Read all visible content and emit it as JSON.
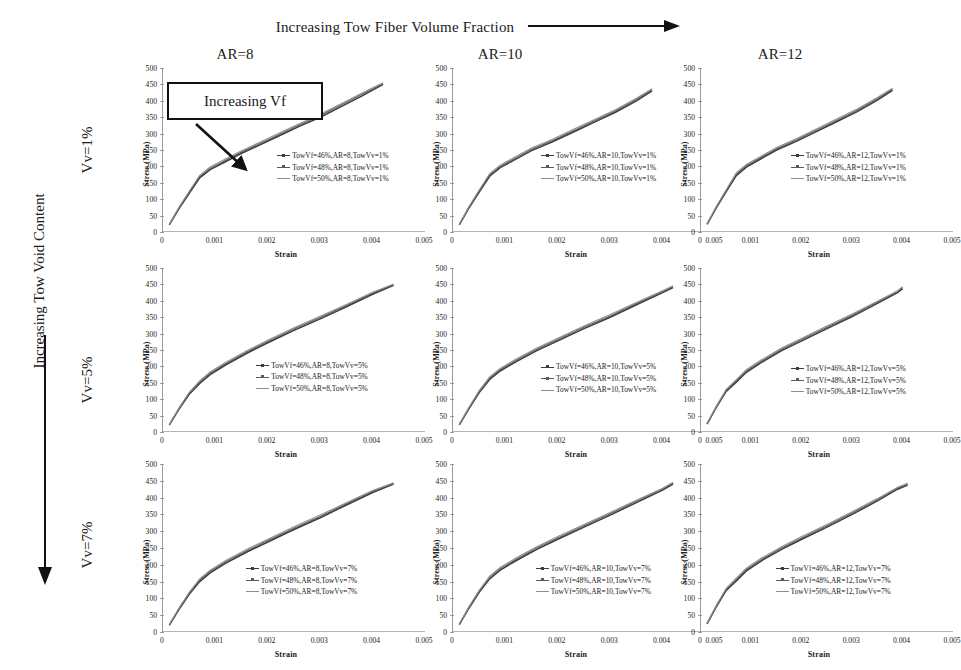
{
  "figure": {
    "top_header": {
      "text": "Increasing Tow Fiber Volume Fraction",
      "arrow": "right-arrow"
    },
    "left_header": {
      "text": "Increasing Tow Void Content",
      "arrow": "down-arrow"
    },
    "column_headers": [
      "AR=8",
      "AR=10",
      "AR=12"
    ],
    "row_headers": [
      "Vv=1%",
      "Vv=5%",
      "Vv=7%"
    ],
    "annotation": {
      "label": "Increasing Vf",
      "arrow": "diagonal-down-right-arrow"
    }
  },
  "axes": {
    "xlabel": "Strain",
    "ylabel": "Stress (MPa)",
    "yticks": [
      0,
      50,
      100,
      150,
      200,
      250,
      300,
      350,
      400,
      450,
      500
    ],
    "xticks": [
      "0",
      "0.001",
      "0.002",
      "0.003",
      "0.004",
      "0.005"
    ],
    "xlim": [
      0,
      0.005
    ],
    "ylim": [
      0,
      500
    ]
  },
  "colors": {
    "series_46": "#3c3c3c",
    "series_48": "#5a5a5a",
    "series_50": "#8d8d8d",
    "axis": "#9a9a9a",
    "text": "#1a1a1a",
    "arrow": "#111111"
  },
  "chart_data": [
    {
      "id": "ar8-vv1",
      "type": "line",
      "title": "AR=8, Vv=1%",
      "row": "Vv=1%",
      "column": "AR=8",
      "xlabel": "Strain",
      "ylabel": "Stress (MPa)",
      "xlim": [
        0,
        0.005
      ],
      "ylim": [
        0,
        500
      ],
      "grid": false,
      "legend_position": "center-right-inside",
      "legend": [
        "TowVf=46%,AR=8,TowVv=1%",
        "TowVf=48%,AR=8,TowVv=1%",
        "TowVf=50%,AR=8,TowVv=1%"
      ],
      "x": [
        0.00012,
        0.0003,
        0.0005,
        0.0007,
        0.0009,
        0.0012,
        0.0015,
        0.0018,
        0.0022,
        0.0026,
        0.003,
        0.0034,
        0.0038,
        0.0042
      ],
      "series": [
        {
          "name": "TowVf=46%,AR=8,TowVv=1%",
          "values": [
            22,
            70,
            118,
            165,
            190,
            215,
            240,
            262,
            292,
            322,
            350,
            382,
            415,
            450
          ]
        },
        {
          "name": "TowVf=48%,AR=8,TowVv=1%",
          "values": [
            23,
            72,
            121,
            169,
            194,
            219,
            244,
            266,
            296,
            326,
            355,
            387,
            420,
            452
          ]
        },
        {
          "name": "TowVf=50%,AR=8,TowVv=1%",
          "values": [
            24,
            74,
            124,
            173,
            198,
            223,
            248,
            270,
            300,
            330,
            359,
            391,
            424,
            455
          ]
        }
      ]
    },
    {
      "id": "ar10-vv1",
      "type": "line",
      "title": "AR=10, Vv=1%",
      "row": "Vv=1%",
      "column": "AR=10",
      "xlabel": "Strain",
      "ylabel": "Stress (MPa)",
      "xlim": [
        0,
        0.005
      ],
      "ylim": [
        0,
        500
      ],
      "grid": false,
      "legend_position": "center-inside",
      "legend": [
        "TowVf=46%,AR=10,TowVv=1%",
        "TowVf=48%,AR=10,TowVv=1%",
        "TowVf=50%,AR=10,TowVv=1%"
      ],
      "x": [
        0.00012,
        0.0003,
        0.0005,
        0.0007,
        0.0009,
        0.0012,
        0.0015,
        0.0019,
        0.0023,
        0.0027,
        0.0031,
        0.0035,
        0.0038
      ],
      "series": [
        {
          "name": "TowVf=46%,AR=10,TowVv=1%",
          "values": [
            22,
            72,
            122,
            170,
            196,
            222,
            248,
            275,
            305,
            335,
            365,
            400,
            430
          ]
        },
        {
          "name": "TowVf=48%,AR=10,TowVv=1%",
          "values": [
            23,
            74,
            125,
            174,
            200,
            226,
            252,
            279,
            309,
            339,
            369,
            404,
            434
          ]
        },
        {
          "name": "TowVf=50%,AR=10,TowVv=1%",
          "values": [
            24,
            76,
            128,
            178,
            204,
            230,
            256,
            283,
            313,
            343,
            373,
            408,
            437
          ]
        }
      ]
    },
    {
      "id": "ar12-vv1",
      "type": "line",
      "title": "AR=12, Vv=1%",
      "row": "Vv=1%",
      "column": "AR=12",
      "xlabel": "Strain",
      "ylabel": "Stress (MPa)",
      "xlim": [
        0,
        0.005
      ],
      "ylim": [
        0,
        500
      ],
      "grid": false,
      "legend_position": "center-inside",
      "legend": [
        "TowVf=46%,AR=12,TowVv=1%",
        "TowVf=48%,AR=12,TowVv=1%",
        "TowVf=50%,AR=12,TowVv=1%"
      ],
      "x": [
        0.00012,
        0.0003,
        0.0005,
        0.0007,
        0.0009,
        0.0012,
        0.0015,
        0.0019,
        0.0023,
        0.0027,
        0.0031,
        0.0035,
        0.0038
      ],
      "series": [
        {
          "name": "TowVf=46%,AR=12,TowVv=1%",
          "values": [
            23,
            73,
            123,
            172,
            198,
            224,
            250,
            277,
            307,
            337,
            367,
            402,
            432
          ]
        },
        {
          "name": "TowVf=48%,AR=12,TowVv=1%",
          "values": [
            24,
            75,
            126,
            176,
            202,
            228,
            254,
            281,
            311,
            341,
            371,
            406,
            435
          ]
        },
        {
          "name": "TowVf=50%,AR=12,TowVv=1%",
          "values": [
            25,
            77,
            129,
            180,
            206,
            232,
            258,
            285,
            315,
            345,
            375,
            410,
            438
          ]
        }
      ]
    },
    {
      "id": "ar8-vv5",
      "type": "line",
      "title": "AR=8, Vv=5%",
      "row": "Vv=5%",
      "column": "AR=8",
      "xlabel": "Strain",
      "ylabel": "Stress (MPa)",
      "xlim": [
        0,
        0.005
      ],
      "ylim": [
        0,
        500
      ],
      "grid": false,
      "legend_position": "center-inside",
      "legend": [
        "TowVf=46%,AR=8,TowVv=5%",
        "TowVf=48%,AR=8,TowVv=5%",
        "TowVf=50%,AR=8,TowVv=5%"
      ],
      "x": [
        0.00012,
        0.0003,
        0.0005,
        0.0007,
        0.0009,
        0.0012,
        0.0016,
        0.002,
        0.0025,
        0.003,
        0.0035,
        0.004,
        0.0044
      ],
      "series": [
        {
          "name": "TowVf=46%,AR=8,TowVv=5%",
          "values": [
            21,
            68,
            115,
            148,
            175,
            205,
            240,
            272,
            310,
            345,
            382,
            420,
            447
          ]
        },
        {
          "name": "TowVf=48%,AR=8,TowVv=5%",
          "values": [
            22,
            70,
            118,
            152,
            179,
            209,
            244,
            276,
            314,
            349,
            386,
            423,
            449
          ]
        },
        {
          "name": "TowVf=50%,AR=8,TowVv=5%",
          "values": [
            23,
            72,
            121,
            156,
            183,
            213,
            248,
            280,
            318,
            353,
            389,
            426,
            451
          ]
        }
      ]
    },
    {
      "id": "ar10-vv5",
      "type": "line",
      "title": "AR=10, Vv=5%",
      "row": "Vv=5%",
      "column": "AR=10",
      "xlabel": "Strain",
      "ylabel": "Stress (MPa)",
      "xlim": [
        0,
        0.005
      ],
      "ylim": [
        0,
        500
      ],
      "grid": false,
      "legend_position": "center-inside",
      "legend": [
        "TowVf=46%,AR=10,TowVv=5%",
        "TowVf=48%,AR=10,TowVv=5%",
        "TowVf=50%,AR=10,TowVv=5%"
      ],
      "x": [
        0.00012,
        0.0003,
        0.0005,
        0.0007,
        0.0009,
        0.0012,
        0.0016,
        0.002,
        0.0025,
        0.003,
        0.0035,
        0.004,
        0.0042
      ],
      "series": [
        {
          "name": "TowVf=46%,AR=10,TowVv=5%",
          "values": [
            22,
            70,
            120,
            160,
            186,
            214,
            248,
            278,
            315,
            350,
            388,
            425,
            440
          ]
        },
        {
          "name": "TowVf=48%,AR=10,TowVv=5%",
          "values": [
            23,
            72,
            123,
            164,
            190,
            218,
            252,
            282,
            319,
            354,
            392,
            428,
            443
          ]
        },
        {
          "name": "TowVf=50%,AR=10,TowVv=5%",
          "values": [
            24,
            74,
            126,
            168,
            194,
            222,
            256,
            286,
            323,
            358,
            395,
            431,
            446
          ]
        }
      ]
    },
    {
      "id": "ar12-vv5",
      "type": "line",
      "title": "AR=12, Vv=5%",
      "row": "Vv=5%",
      "column": "AR=12",
      "xlabel": "Strain",
      "ylabel": "Stress (MPa)",
      "xlim": [
        0,
        0.005
      ],
      "ylim": [
        0,
        500
      ],
      "grid": false,
      "legend_position": "center-inside",
      "legend": [
        "TowVf=46%,AR=12,TowVv=5%",
        "TowVf=48%,AR=12,TowVv=5%",
        "TowVf=50%,AR=12,TowVv=5%"
      ],
      "x": [
        0.00012,
        0.0003,
        0.0005,
        0.0007,
        0.0009,
        0.0012,
        0.0016,
        0.002,
        0.0025,
        0.003,
        0.0035,
        0.0039,
        0.004
      ],
      "series": [
        {
          "name": "TowVf=46%,AR=12,TowVv=5%",
          "values": [
            24,
            74,
            124,
            152,
            182,
            212,
            248,
            278,
            315,
            352,
            392,
            425,
            437
          ]
        },
        {
          "name": "TowVf=48%,AR=12,TowVv=5%",
          "values": [
            25,
            76,
            127,
            156,
            186,
            216,
            252,
            282,
            319,
            356,
            396,
            428,
            440
          ]
        },
        {
          "name": "TowVf=50%,AR=12,TowVv=5%",
          "values": [
            26,
            78,
            130,
            160,
            190,
            220,
            256,
            286,
            323,
            360,
            399,
            431,
            443
          ]
        }
      ]
    },
    {
      "id": "ar8-vv7",
      "type": "line",
      "title": "AR=8, Vv=7%",
      "row": "Vv=7%",
      "column": "AR=8",
      "xlabel": "Strain",
      "ylabel": "Stress (MPa)",
      "xlim": [
        0,
        0.005
      ],
      "ylim": [
        0,
        500
      ],
      "grid": false,
      "legend_position": "center-inside",
      "legend": [
        "TowVf=46%,AR=8,TowVv=7%",
        "TowVf=48%,AR=8,TowVv=7%",
        "TowVf=50%,AR=8,TowVv=7%"
      ],
      "x": [
        0.00012,
        0.0003,
        0.0005,
        0.0007,
        0.0009,
        0.0012,
        0.0016,
        0.002,
        0.0025,
        0.003,
        0.0035,
        0.004,
        0.0044
      ],
      "series": [
        {
          "name": "TowVf=46%,AR=8,TowVv=7%",
          "values": [
            20,
            66,
            112,
            150,
            176,
            205,
            238,
            268,
            305,
            340,
            378,
            415,
            440
          ]
        },
        {
          "name": "TowVf=48%,AR=8,TowVv=7%",
          "values": [
            21,
            68,
            115,
            154,
            180,
            209,
            242,
            272,
            309,
            344,
            382,
            418,
            442
          ]
        },
        {
          "name": "TowVf=50%,AR=8,TowVv=7%",
          "values": [
            22,
            70,
            118,
            158,
            184,
            213,
            246,
            276,
            313,
            348,
            385,
            421,
            444
          ]
        }
      ]
    },
    {
      "id": "ar10-vv7",
      "type": "line",
      "title": "AR=10, Vv=7%",
      "row": "Vv=7%",
      "column": "AR=10",
      "xlabel": "Strain",
      "ylabel": "Stress (MPa)",
      "xlim": [
        0,
        0.005
      ],
      "ylim": [
        0,
        500
      ],
      "grid": false,
      "legend_position": "center-inside",
      "legend": [
        "TowVf=46%,AR=10,TowVv=7%",
        "TowVf=48%,AR=10,TowVv=7%",
        "TowVf=50%,AR=10,TowVv=7%"
      ],
      "x": [
        0.00012,
        0.0003,
        0.0005,
        0.0007,
        0.0009,
        0.0012,
        0.0016,
        0.002,
        0.0025,
        0.003,
        0.0035,
        0.004,
        0.0042
      ],
      "series": [
        {
          "name": "TowVf=46%,AR=10,TowVv=7%",
          "values": [
            22,
            70,
            118,
            158,
            184,
            212,
            246,
            276,
            312,
            348,
            385,
            422,
            440
          ]
        },
        {
          "name": "TowVf=48%,AR=10,TowVv=7%",
          "values": [
            23,
            72,
            121,
            162,
            188,
            216,
            250,
            280,
            316,
            352,
            389,
            425,
            443
          ]
        },
        {
          "name": "TowVf=50%,AR=10,TowVv=7%",
          "values": [
            24,
            74,
            124,
            166,
            192,
            220,
            254,
            284,
            320,
            356,
            392,
            428,
            446
          ]
        }
      ]
    },
    {
      "id": "ar12-vv7",
      "type": "line",
      "title": "AR=12, Vv=7%",
      "row": "Vv=7%",
      "column": "AR=12",
      "xlabel": "Strain",
      "ylabel": "Stress (MPa)",
      "xlim": [
        0,
        0.005
      ],
      "ylim": [
        0,
        500
      ],
      "grid": false,
      "legend_position": "center-inside",
      "legend": [
        "TowVf=46%,AR=12,TowVv=7%",
        "TowVf=48%,AR=12,TowVv=7%",
        "TowVf=50%,AR=12,TowVv=7%"
      ],
      "x": [
        0.00012,
        0.0003,
        0.0005,
        0.0007,
        0.0009,
        0.0012,
        0.0016,
        0.002,
        0.0025,
        0.003,
        0.0035,
        0.0039,
        0.0041
      ],
      "series": [
        {
          "name": "TowVf=46%,AR=12,TowVv=7%",
          "values": [
            24,
            74,
            124,
            152,
            182,
            212,
            246,
            276,
            312,
            350,
            390,
            425,
            437
          ]
        },
        {
          "name": "TowVf=48%,AR=12,TowVv=7%",
          "values": [
            25,
            76,
            127,
            156,
            186,
            216,
            250,
            280,
            316,
            354,
            394,
            428,
            440
          ]
        },
        {
          "name": "TowVf=50%,AR=12,TowVv=7%",
          "values": [
            26,
            78,
            130,
            160,
            190,
            220,
            254,
            284,
            320,
            358,
            397,
            431,
            443
          ]
        }
      ]
    }
  ]
}
